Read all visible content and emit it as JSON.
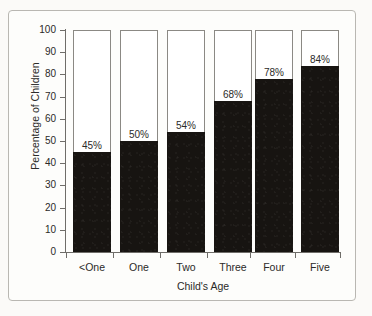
{
  "chart_data": {
    "type": "bar",
    "title": "",
    "subtitle": "",
    "xlabel": "Child's Age",
    "ylabel": "Percentage of Children",
    "categories": [
      "<One",
      "One",
      "Two",
      "Three",
      "Four",
      "Five"
    ],
    "values": [
      45,
      50,
      54,
      68,
      78,
      84
    ],
    "data_labels": [
      "45%",
      "50%",
      "54%",
      "68%",
      "78%",
      "84%"
    ],
    "ylim": [
      0,
      100
    ],
    "y_ticks": [
      0,
      10,
      20,
      30,
      40,
      50,
      60,
      70,
      80,
      90,
      100
    ],
    "y_tick_labels": [
      "0",
      "10",
      "20",
      "30",
      "40",
      "50",
      "60",
      "70",
      "80",
      "90",
      "100"
    ],
    "grid": false,
    "legend": "none",
    "bar_fill_color": "#171411",
    "bar_outline_color": "#8b8984",
    "axis_color": "#6f6d69",
    "text_color": "#2b2a28",
    "background_color": "#fdfdfb",
    "note": "Each bar is drawn as a full-height 100% outline with the value filled solid black from the baseline."
  }
}
